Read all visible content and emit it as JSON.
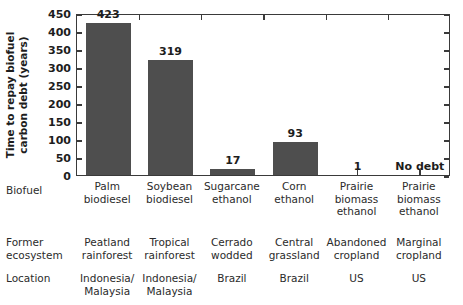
{
  "chart_data": {
    "type": "bar",
    "title": "",
    "xlabel": "",
    "ylabel_lines": [
      "Time to repay biofuel",
      "carbon debt (years)"
    ],
    "ylabel": "Time to repay biofuel carbon debt (years)",
    "ylim": [
      0,
      450
    ],
    "yticks": [
      0,
      50,
      100,
      150,
      200,
      250,
      300,
      350,
      400,
      450
    ],
    "ytick_labels": [
      "0",
      "50",
      "100",
      "150",
      "200",
      "250",
      "300",
      "350",
      "400",
      "450"
    ],
    "grid": false,
    "legend": "none",
    "bar_color": "#4e4e4e",
    "categories": [
      "Palm biodiesel",
      "Soybean biodiesel",
      "Sugarcane ethanol",
      "Corn ethanol",
      "Prairie biomass ethanol",
      "Prairie biomass ethanol"
    ],
    "category_label_lines": [
      [
        "Palm",
        "biodiesel"
      ],
      [
        "Soybean",
        "biodiesel"
      ],
      [
        "Sugarcane",
        "ethanol"
      ],
      [
        "Corn",
        "ethanol"
      ],
      [
        "Prairie",
        "biomass",
        "ethanol"
      ],
      [
        "Prairie",
        "biomass",
        "ethanol"
      ]
    ],
    "values": [
      423,
      319,
      17,
      93,
      1,
      0
    ],
    "value_labels": [
      "423",
      "319",
      "17",
      "93",
      "1",
      "No debt"
    ]
  },
  "table": {
    "row_labels": [
      {
        "lines": [
          "Biofuel"
        ]
      },
      {
        "lines": [
          "Former",
          "ecosystem"
        ]
      },
      {
        "lines": [
          "Location"
        ]
      }
    ],
    "rows": {
      "biofuel": [
        [
          "Palm",
          "biodiesel"
        ],
        [
          "Soybean",
          "biodiesel"
        ],
        [
          "Sugarcane",
          "ethanol"
        ],
        [
          "Corn",
          "ethanol"
        ],
        [
          "Prairie",
          "biomass",
          "ethanol"
        ],
        [
          "Prairie",
          "biomass",
          "ethanol"
        ]
      ],
      "ecosystem": [
        [
          "Peatland",
          "rainforest"
        ],
        [
          "Tropical",
          "rainforest"
        ],
        [
          "Cerrado",
          "wodded"
        ],
        [
          "Central",
          "grassland"
        ],
        [
          "Abandoned",
          "cropland"
        ],
        [
          "Marginal",
          "cropland"
        ]
      ],
      "location": [
        [
          "Indonesia/",
          "Malaysia"
        ],
        [
          "Indonesia/",
          "Malaysia"
        ],
        [
          "Brazil"
        ],
        [
          "Brazil"
        ],
        [
          "US"
        ],
        [
          "US"
        ]
      ]
    }
  },
  "colors": {
    "bar": "#4e4e4e",
    "axis": "#3a3a3a",
    "text": "#2b2b2b"
  }
}
